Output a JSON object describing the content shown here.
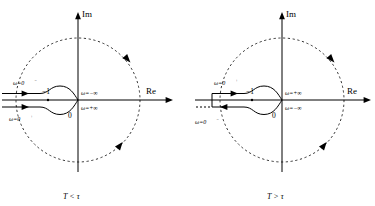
{
  "figure": {
    "type": "nyquist-contour-pair",
    "background": "#ffffff",
    "stroke": "#000000",
    "panels": [
      {
        "id": "left",
        "caption": "T < τ",
        "axis": {
          "im_label": "Im",
          "re_label": "Re",
          "origin_label": "0"
        },
        "pole_label": "−1",
        "branch_labels": {
          "upper_left": "ω=0",
          "upper_left_sup": "−",
          "lower_left": "ω=0",
          "lower_left_sup": "+",
          "upper_right": "ω=−∞",
          "lower_right": "ω=+∞"
        },
        "dashed_circle": true,
        "circle_arrow_count": 2,
        "contour_arrow_dirs": [
          "right",
          "right"
        ]
      },
      {
        "id": "right",
        "caption": "T > τ",
        "axis": {
          "im_label": "Im",
          "re_label": "Re",
          "origin_label": "0"
        },
        "pole_label": "−1",
        "branch_labels": {
          "upper_left": "ω=0",
          "upper_left_sup": "+",
          "lower_left": "ω=0",
          "lower_left_sup": "−",
          "upper_right": "ω=+∞",
          "lower_right": "ω=−∞"
        },
        "dashed_circle": true,
        "circle_arrow_count": 2,
        "contour_arrow_dirs": [
          "right",
          "left"
        ]
      }
    ]
  }
}
